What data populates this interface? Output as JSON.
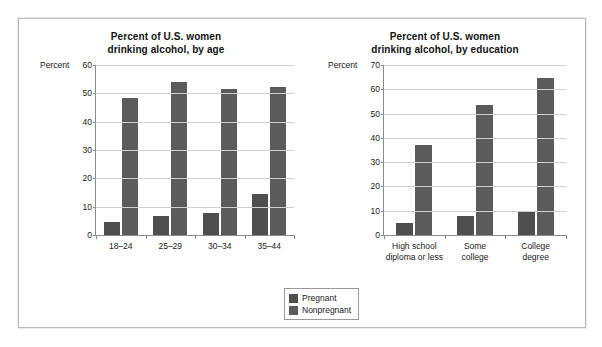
{
  "figure": {
    "border_color": "#b9b9b9",
    "background": "#ffffff"
  },
  "legend": {
    "position": "bottom-center",
    "entries": [
      {
        "label": "Pregnant",
        "color": "#4f4f4f"
      },
      {
        "label": "Nonpregnant",
        "color": "#5b5b5b"
      }
    ]
  },
  "charts": [
    {
      "id": "by-age",
      "title": "Percent of U.S. women\ndrinking alcohol, by age",
      "axis_unit": "Percent"
    },
    {
      "id": "by-education",
      "title": "Percent of U.S. women\ndrinking alcohol, by education",
      "axis_unit": "Percent"
    }
  ],
  "chart_data": [
    {
      "type": "bar",
      "title": "Percent of U.S. women drinking alcohol, by age",
      "xlabel": "",
      "ylabel": "Percent",
      "ylim": [
        0,
        60
      ],
      "yticks": [
        0,
        10,
        20,
        30,
        40,
        50,
        60
      ],
      "ytick_labels": [
        "0",
        "10",
        "20",
        "30",
        "40",
        "50",
        "60"
      ],
      "grid": true,
      "legend_position": "bottom-center",
      "categories": [
        "18–24",
        "25–29",
        "30–34",
        "35–44"
      ],
      "series": [
        {
          "name": "Pregnant",
          "color": "#4f4f4f",
          "values": [
            4.5,
            6.7,
            7.7,
            14.3
          ]
        },
        {
          "name": "Nonpregnant",
          "color": "#5b5b5b",
          "values": [
            48.5,
            54.0,
            51.5,
            52.3
          ]
        }
      ]
    },
    {
      "type": "bar",
      "title": "Percent of U.S. women drinking alcohol, by education",
      "xlabel": "",
      "ylabel": "Percent",
      "ylim": [
        0,
        70
      ],
      "yticks": [
        0,
        10,
        20,
        30,
        40,
        50,
        60,
        70
      ],
      "ytick_labels": [
        "0",
        "10",
        "20",
        "30",
        "40",
        "50",
        "60",
        "70"
      ],
      "grid": true,
      "legend_position": "bottom-center",
      "categories": [
        "High school\ndiploma or less",
        "Some\ncollege",
        "College\ndegree"
      ],
      "series": [
        {
          "name": "Pregnant",
          "color": "#4f4f4f",
          "values": [
            4.8,
            7.7,
            10.0
          ]
        },
        {
          "name": "Nonpregnant",
          "color": "#5b5b5b",
          "values": [
            37.2,
            53.5,
            64.5
          ]
        }
      ]
    }
  ]
}
